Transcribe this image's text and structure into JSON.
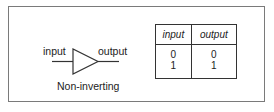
{
  "diagram": {
    "gate": {
      "type": "buffer",
      "input_label": "input",
      "output_label": "output",
      "caption": "Non-inverting"
    },
    "truth_table": {
      "headers": [
        "input",
        "output"
      ],
      "rows": [
        [
          "0",
          "0"
        ],
        [
          "1",
          "1"
        ]
      ]
    }
  }
}
